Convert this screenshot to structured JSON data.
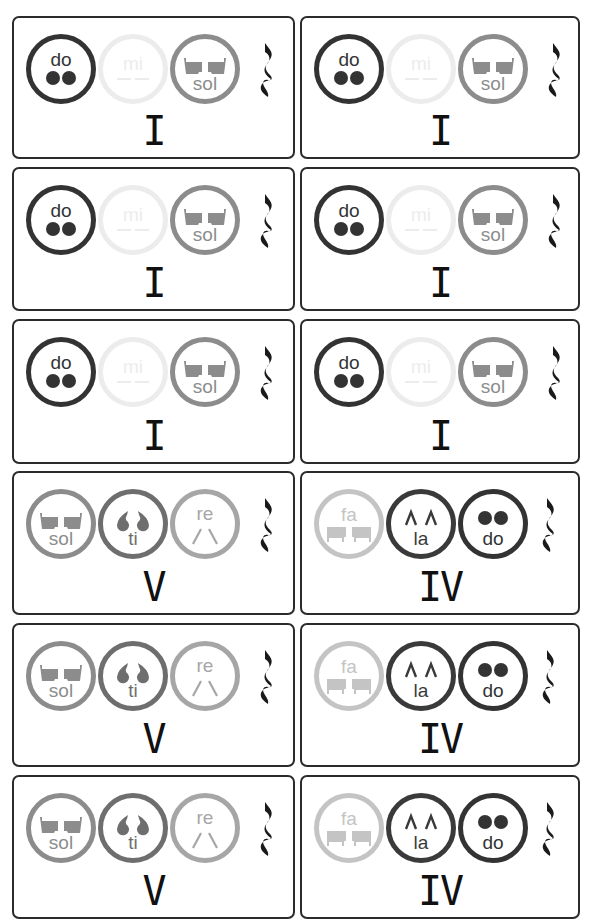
{
  "top_cut_text": "",
  "colors": {
    "do": "#333333",
    "mi": "#ececec",
    "sol": "#8c8c8c",
    "ti": "#6e6e6e",
    "re": "#a6a6a6",
    "fa": "#c4c4c4",
    "la": "#3a3a3a",
    "border": "#2b2b2b"
  },
  "cards": [
    {
      "numeral": "I",
      "notes": [
        "do",
        "mi",
        "sol"
      ]
    },
    {
      "numeral": "I",
      "notes": [
        "do",
        "mi",
        "sol"
      ]
    },
    {
      "numeral": "I",
      "notes": [
        "do",
        "mi",
        "sol"
      ]
    },
    {
      "numeral": "I",
      "notes": [
        "do",
        "mi",
        "sol"
      ]
    },
    {
      "numeral": "I",
      "notes": [
        "do",
        "mi",
        "sol"
      ]
    },
    {
      "numeral": "I",
      "notes": [
        "do",
        "mi",
        "sol"
      ]
    },
    {
      "numeral": "V",
      "notes": [
        "sol",
        "ti",
        "re"
      ]
    },
    {
      "numeral": "IV",
      "notes": [
        "fa",
        "la",
        "do"
      ]
    },
    {
      "numeral": "V",
      "notes": [
        "sol",
        "ti",
        "re"
      ]
    },
    {
      "numeral": "IV",
      "notes": [
        "fa",
        "la",
        "do"
      ]
    },
    {
      "numeral": "V",
      "notes": [
        "sol",
        "ti",
        "re"
      ]
    },
    {
      "numeral": "IV",
      "notes": [
        "fa",
        "la",
        "do"
      ]
    }
  ],
  "rest_symbol": "quarter-rest"
}
